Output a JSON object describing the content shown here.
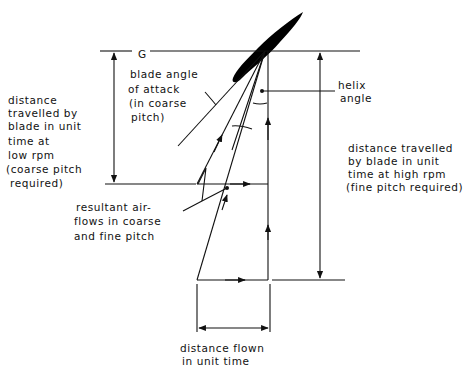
{
  "diagram": {
    "title_cropped": "",
    "rotation_symbol": "G",
    "labels": {
      "blade_angle": [
        "blade angle",
        "of attack",
        "(in coarse",
        "pitch)"
      ],
      "helix_angle": [
        "helix",
        "angle"
      ],
      "low_rpm": [
        "distance",
        "travelled by",
        "blade in unit",
        "time at",
        "low rpm",
        "(coarse pitch",
        "required)"
      ],
      "high_rpm": [
        "distance travelled",
        "by blade in unit",
        "time at high rpm",
        "(fine pitch required)"
      ],
      "resultant": [
        "resultant air-",
        "flows in coarse",
        "and fine pitch"
      ],
      "distance_flown": [
        "distance flown",
        "in unit time"
      ]
    },
    "colors": {
      "ink": "#111111",
      "background": "#ffffff"
    }
  }
}
